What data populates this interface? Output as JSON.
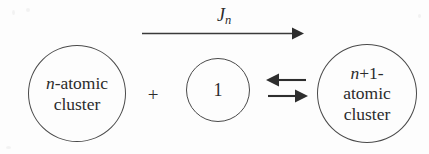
{
  "figure": {
    "kind": "reaction-scheme",
    "background_color": "#fdfdfd",
    "stroke_color": "#4a4a4a",
    "text_color": "#2b2b2b"
  },
  "left_cluster": {
    "name": "n-atomic cluster",
    "line1_italic": "n",
    "line1_rest": "-atomic",
    "line2": "cluster"
  },
  "plus": {
    "symbol": "+"
  },
  "monomer": {
    "label": "1"
  },
  "right_cluster": {
    "name": "n+1-atomic cluster",
    "line1_italic": "n",
    "line1_rest": "+1-",
    "line2": "atomic",
    "line3": "cluster"
  },
  "flux_arrow": {
    "label_base": "J",
    "label_subscript": "n",
    "direction": "right",
    "description": "growth flux arrow from n-atomic cluster to n+1-atomic cluster"
  },
  "equilibrium_arrows": {
    "top_direction": "left",
    "bottom_direction": "right",
    "description": "reversible reaction double arrow"
  }
}
